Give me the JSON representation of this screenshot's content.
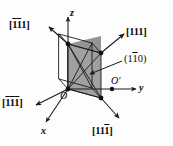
{
  "figure": {
    "type": "crystal-unit-cell-diagram",
    "background_color": "#fdfdfd",
    "line_color": "#1a1a1a",
    "plane_fill_color": "#9b9b9b",
    "vertex_color": "#111111"
  },
  "axes": [
    {
      "name": "x-axis",
      "label": "x",
      "direction": "lower-left-front"
    },
    {
      "name": "y-axis",
      "label": "y",
      "direction": "right"
    },
    {
      "name": "z-axis",
      "label": "z",
      "direction": "up"
    }
  ],
  "origins": [
    {
      "name": "origin-O",
      "label": "O"
    },
    {
      "name": "origin-O-prime",
      "label": "O′"
    }
  ],
  "directions": [
    {
      "name": "direction-1bar1bar1",
      "label_parts": [
        {
          "text": "[",
          "bar": false
        },
        {
          "text": "1",
          "bar": true
        },
        {
          "text": "1",
          "bar": true
        },
        {
          "text": "1",
          "bar": false
        },
        {
          "text": "]",
          "bar": false
        }
      ],
      "plain": "[-1-11]",
      "position": "upper-left"
    },
    {
      "name": "direction-111",
      "label_parts": [
        {
          "text": "[",
          "bar": false
        },
        {
          "text": "1",
          "bar": false
        },
        {
          "text": "1",
          "bar": false
        },
        {
          "text": "1",
          "bar": false
        },
        {
          "text": "]",
          "bar": false
        }
      ],
      "plain": "[111]",
      "position": "upper-right"
    },
    {
      "name": "direction-1bar1bar1bar",
      "label_parts": [
        {
          "text": "[",
          "bar": false
        },
        {
          "text": "1",
          "bar": true
        },
        {
          "text": "1",
          "bar": true
        },
        {
          "text": "1",
          "bar": true
        },
        {
          "text": "]",
          "bar": false
        }
      ],
      "plain": "[-1-1-1]",
      "position": "lower-left"
    },
    {
      "name": "direction-111bar",
      "label_parts": [
        {
          "text": "[",
          "bar": false
        },
        {
          "text": "1",
          "bar": false
        },
        {
          "text": "1",
          "bar": false
        },
        {
          "text": "1",
          "bar": true
        },
        {
          "text": "]",
          "bar": false
        }
      ],
      "plain": "[11-1]",
      "position": "lower-right"
    }
  ],
  "plane": {
    "name": "plane-1bar10",
    "label_parts": [
      {
        "text": "(",
        "bar": false
      },
      {
        "text": "1",
        "bar": false
      },
      {
        "text": "1",
        "bar": true
      },
      {
        "text": "0",
        "bar": false
      },
      {
        "text": ")",
        "bar": false
      }
    ],
    "plain": "(1-10)",
    "position": "right"
  }
}
